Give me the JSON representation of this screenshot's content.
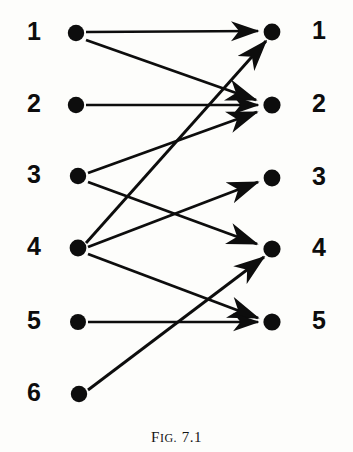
{
  "figure": {
    "caption_prefix": "F",
    "caption_prefix_rest": "IG.",
    "caption_number": "7.1",
    "caption_full": "FIG. 7.1",
    "background_color": "#fdfdfb",
    "ink_color": "#0d0d0d"
  },
  "graph": {
    "type": "directed bipartite graph",
    "left_nodes": [
      {
        "label": "1",
        "x": 76,
        "y": 33
      },
      {
        "label": "2",
        "x": 76,
        "y": 105
      },
      {
        "label": "3",
        "x": 78,
        "y": 176
      },
      {
        "label": "4",
        "x": 78,
        "y": 248
      },
      {
        "label": "5",
        "x": 78,
        "y": 322
      },
      {
        "label": "6",
        "x": 79,
        "y": 394
      }
    ],
    "right_nodes": [
      {
        "label": "1",
        "x": 272,
        "y": 32
      },
      {
        "label": "2",
        "x": 272,
        "y": 105
      },
      {
        "label": "3",
        "x": 272,
        "y": 178
      },
      {
        "label": "4",
        "x": 272,
        "y": 249
      },
      {
        "label": "5",
        "x": 272,
        "y": 322
      }
    ],
    "left_label_positions": [
      {
        "label": "1",
        "x": 21,
        "y": 19
      },
      {
        "label": "2",
        "x": 21,
        "y": 91
      },
      {
        "label": "3",
        "x": 21,
        "y": 162
      },
      {
        "label": "4",
        "x": 21,
        "y": 234
      },
      {
        "label": "5",
        "x": 21,
        "y": 308
      },
      {
        "label": "6",
        "x": 21,
        "y": 380
      }
    ],
    "right_label_positions": [
      {
        "label": "1",
        "x": 306,
        "y": 18
      },
      {
        "label": "2",
        "x": 306,
        "y": 91
      },
      {
        "label": "3",
        "x": 306,
        "y": 164
      },
      {
        "label": "4",
        "x": 306,
        "y": 235
      },
      {
        "label": "5",
        "x": 306,
        "y": 308
      }
    ],
    "edges": [
      {
        "from": "L1",
        "to": "R1",
        "name": "edge-l1-r1"
      },
      {
        "from": "L1",
        "to": "R2",
        "name": "edge-l1-r2"
      },
      {
        "from": "L2",
        "to": "R2",
        "name": "edge-l2-r2"
      },
      {
        "from": "L3",
        "to": "R2",
        "name": "edge-l3-r2"
      },
      {
        "from": "L3",
        "to": "R4",
        "name": "edge-l3-r4"
      },
      {
        "from": "L4",
        "to": "R1",
        "name": "edge-l4-r1"
      },
      {
        "from": "L4",
        "to": "R3",
        "name": "edge-l4-r3"
      },
      {
        "from": "L4",
        "to": "R5",
        "name": "edge-l4-r5"
      },
      {
        "from": "L5",
        "to": "R5",
        "name": "edge-l5-r5"
      },
      {
        "from": "L6",
        "to": "R4",
        "name": "edge-l6-r4"
      }
    ],
    "edge_count": "10",
    "left_node_count": "6",
    "right_node_count": "5"
  }
}
